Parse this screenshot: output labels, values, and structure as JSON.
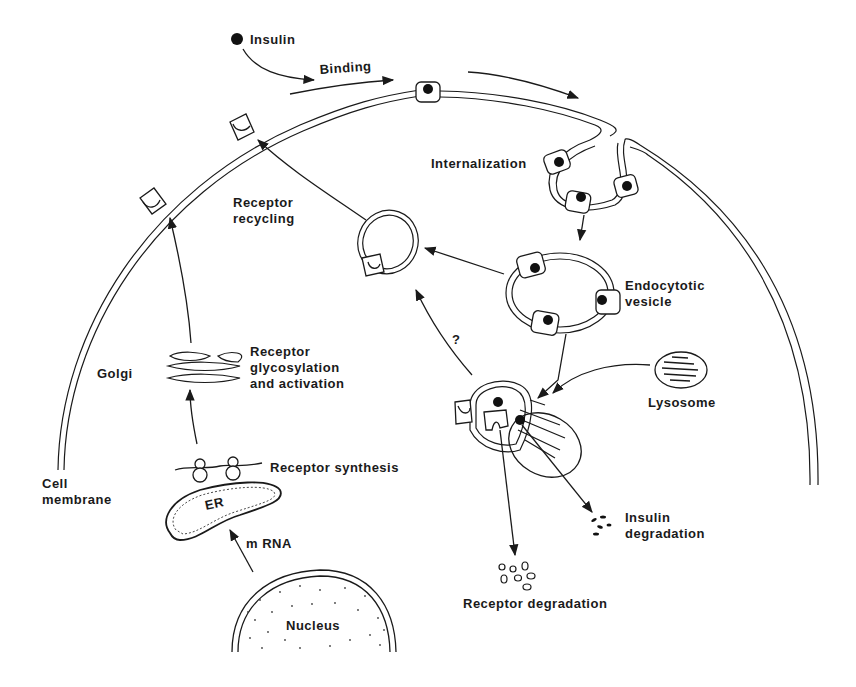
{
  "diagram": {
    "labels": {
      "insulin": "Insulin",
      "binding": "Binding",
      "internalization": "Internalization",
      "receptor_recycling_1": "Receptor",
      "receptor_recycling_2": "recycling",
      "endocytotic_1": "Endocytotic",
      "endocytotic_2": "vesicle",
      "question": "?",
      "golgi": "Golgi",
      "glyco_1": "Receptor",
      "glyco_2": "glycosylation",
      "glyco_3": "and activation",
      "lysosome": "Lysosome",
      "cell_membrane_1": "Cell",
      "cell_membrane_2": "membrane",
      "receptor_synthesis": "Receptor synthesis",
      "er": "ER",
      "mrna": "m RNA",
      "insulin_degradation_1": "Insulin",
      "insulin_degradation_2": "degradation",
      "receptor_degradation": "Receptor degradation",
      "nucleus": "Nucleus"
    },
    "colors": {
      "ink": "#1a1a1a",
      "background": "#ffffff"
    }
  }
}
